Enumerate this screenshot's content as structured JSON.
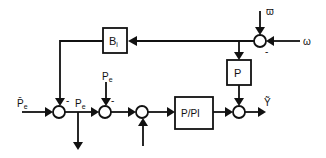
{
  "diagram": {
    "type": "control block diagram",
    "blocks": {
      "bi": {
        "label": "B",
        "subscript": "i"
      },
      "p": {
        "label": "P"
      },
      "ppi": {
        "label": "P/PI"
      }
    },
    "signals": {
      "omega_ref": "ϖ",
      "omega": "ω",
      "pe_bar": "P̄",
      "pe_bar_sub": "e",
      "pe_tilde": "P",
      "pe_tilde_sub": "e",
      "pe": "P",
      "pe_sub": "e",
      "output": "Ỹ"
    },
    "signs": {
      "sum_omega_minus": "-",
      "sum1_minus": "-",
      "sum2_minus": "-"
    }
  }
}
